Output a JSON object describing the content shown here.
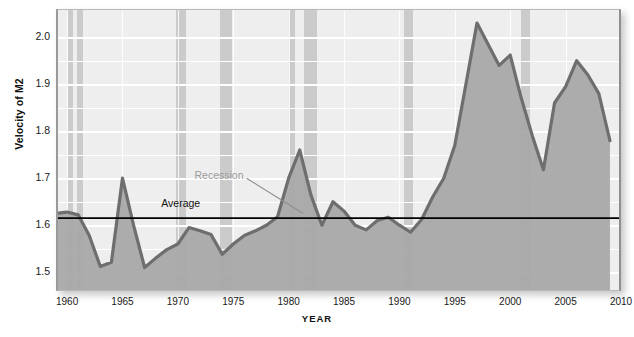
{
  "title": "",
  "axis": {
    "ylabel": "Velocity of M2",
    "xlabel": "YEAR",
    "yticks": [
      "2.0",
      "1.9",
      "1.8",
      "1.7",
      "1.6",
      "1.5"
    ],
    "xticks": [
      "1960",
      "1965",
      "1970",
      "1975",
      "1980",
      "1985",
      "1990",
      "1995",
      "2000",
      "2005",
      "2010"
    ]
  },
  "annotations": {
    "recession": "Recession",
    "average": "Average"
  },
  "colors": {
    "plot_background": "#eeeeee",
    "recession_band": "#c4c4c4",
    "area_fill": "#a8a8a8",
    "line": "#6e6e6e",
    "average_line": "#000000",
    "gridline": "#ffffff",
    "recession_label": "#9c9c9c"
  },
  "chart_data": {
    "type": "line",
    "title": "Velocity of M2",
    "xlabel": "YEAR",
    "ylabel": "Velocity of M2",
    "xlim": [
      1959,
      2010
    ],
    "ylim": [
      1.46,
      2.06
    ],
    "ytick_values": [
      1.5,
      1.6,
      1.7,
      1.8,
      1.9,
      2.0
    ],
    "minor_gridline_step": 0.05,
    "xtick_values": [
      1960,
      1965,
      1970,
      1975,
      1980,
      1985,
      1990,
      1995,
      2000,
      2005,
      2010
    ],
    "grid": true,
    "legend": "none",
    "fill": "area-below-curve",
    "average_line_value": 1.615,
    "series": [
      {
        "name": "Velocity of M2",
        "x": [
          1959,
          1960,
          1961,
          1962,
          1963,
          1964,
          1965,
          1966,
          1967,
          1968,
          1969,
          1970,
          1971,
          1972,
          1973,
          1974,
          1975,
          1976,
          1977,
          1978,
          1979,
          1980,
          1981,
          1982,
          1983,
          1984,
          1985,
          1986,
          1987,
          1988,
          1989,
          1990,
          1991,
          1992,
          1993,
          1994,
          1995,
          1996,
          1997,
          1998,
          1999,
          2000,
          2001,
          2002,
          2003,
          2004,
          2005,
          2006,
          2007,
          2008,
          2009
        ],
        "y": [
          1.625,
          1.628,
          1.622,
          1.578,
          1.512,
          1.521,
          1.7,
          1.6,
          1.51,
          1.53,
          1.548,
          1.56,
          1.595,
          1.588,
          1.58,
          1.538,
          1.56,
          1.578,
          1.588,
          1.6,
          1.618,
          1.7,
          1.76,
          1.665,
          1.6,
          1.65,
          1.63,
          1.6,
          1.59,
          1.61,
          1.617,
          1.6,
          1.585,
          1.612,
          1.66,
          1.7,
          1.77,
          1.9,
          2.03,
          1.985,
          1.94,
          1.962,
          1.87,
          1.79,
          1.718,
          1.86,
          1.895,
          1.95,
          1.92,
          1.88,
          1.78
        ]
      }
    ],
    "recession_bands": [
      {
        "start": 1960.1,
        "end": 1960.5
      },
      {
        "start": 1960.9,
        "end": 1961.4
      },
      {
        "start": 1969.8,
        "end": 1970.7
      },
      {
        "start": 1973.8,
        "end": 1974.9
      },
      {
        "start": 1980.0,
        "end": 1980.6
      },
      {
        "start": 1981.4,
        "end": 1982.6
      },
      {
        "start": 1990.4,
        "end": 1991.2
      },
      {
        "start": 2001.0,
        "end": 2001.8
      }
    ],
    "annotations": [
      {
        "text": "Recession",
        "x": 1971.5,
        "y": 1.705,
        "color": "#9c9c9c"
      },
      {
        "text": "Average",
        "x": 1968.5,
        "y": 1.645,
        "color": "#111111"
      }
    ]
  }
}
